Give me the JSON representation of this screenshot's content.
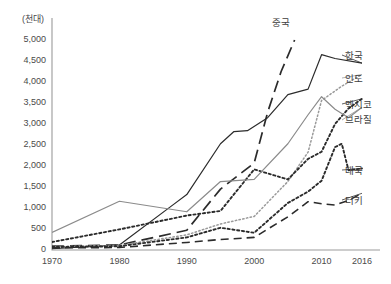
{
  "chart_data": {
    "type": "line",
    "title": "",
    "subtitle": "",
    "xlabel": "",
    "ylabel": "(천대)",
    "unit_label": "(천대)",
    "grid": false,
    "legend_position": "right-inline",
    "xlim": [
      1970,
      2016
    ],
    "ylim": [
      0,
      5000
    ],
    "ytick_labels": [
      "5,000",
      "4,500",
      "4,000",
      "3,500",
      "3,000",
      "2,500",
      "2,000",
      "1,500",
      "1,000",
      "500",
      "0"
    ],
    "ytick_values": [
      5000,
      4500,
      4000,
      3500,
      3000,
      2500,
      2000,
      1500,
      1000,
      500,
      0
    ],
    "xtick_labels": [
      "1970",
      "1980",
      "1990",
      "2000",
      "2010",
      "2016"
    ],
    "xtick_values": [
      1970,
      1980,
      1990,
      2000,
      2010,
      2016
    ],
    "series": [
      {
        "name": "중국",
        "label": "중국",
        "style": "long-dash",
        "color": "#2b2b2b",
        "x": [
          1970,
          1980,
          1990,
          1995,
          2000,
          2002,
          2004,
          2006
        ],
        "values": [
          90,
          120,
          470,
          1450,
          2070,
          3280,
          4250,
          5000
        ]
      },
      {
        "name": "한국",
        "label": "한국",
        "style": "solid",
        "color": "#2b2b2b",
        "x": [
          1970,
          1980,
          1988,
          1990,
          1995,
          1997,
          1999,
          2002,
          2005,
          2008,
          2010,
          2012,
          2016
        ],
        "values": [
          30,
          120,
          1080,
          1320,
          2530,
          2820,
          2840,
          3150,
          3700,
          3830,
          4650,
          4560,
          4450
        ]
      },
      {
        "name": "인도",
        "label": "인도",
        "style": "fine-dotted",
        "color": "#9a9a9a",
        "x": [
          1970,
          1980,
          1990,
          1995,
          2000,
          2005,
          2008,
          2010,
          2013,
          2016
        ],
        "values": [
          80,
          110,
          360,
          620,
          800,
          1630,
          2330,
          3560,
          3900,
          4180
        ]
      },
      {
        "name": "멕시코",
        "label": "멕시코",
        "style": "dotted",
        "color": "#2b2b2b",
        "x": [
          1970,
          1980,
          1990,
          1995,
          2000,
          2005,
          2008,
          2010,
          2012,
          2014,
          2016
        ],
        "values": [
          190,
          490,
          820,
          930,
          1920,
          1680,
          2170,
          2340,
          3000,
          3370,
          3600
        ]
      },
      {
        "name": "브라질",
        "label": "브라질",
        "style": "solid",
        "color": "#8b8b8b",
        "x": [
          1970,
          1980,
          1990,
          1995,
          2000,
          2005,
          2008,
          2010,
          2012,
          2014,
          2016
        ],
        "values": [
          420,
          1160,
          910,
          1630,
          1680,
          2530,
          3220,
          3650,
          3350,
          3150,
          3400
        ]
      },
      {
        "name": "태국",
        "label": "태국",
        "style": "dotted",
        "color": "#2b2b2b",
        "x": [
          1970,
          1980,
          1990,
          1995,
          2000,
          2005,
          2008,
          2010,
          2012,
          2013,
          2014,
          2016
        ],
        "values": [
          70,
          90,
          300,
          530,
          410,
          1120,
          1390,
          1650,
          2450,
          2530,
          1900,
          1940
        ]
      },
      {
        "name": "터키",
        "label": "터키",
        "style": "dash",
        "color": "#2b2b2b",
        "x": [
          1970,
          1980,
          1990,
          1995,
          2000,
          2005,
          2008,
          2010,
          2012,
          2014,
          2016
        ],
        "values": [
          50,
          60,
          180,
          250,
          300,
          790,
          1150,
          1100,
          1070,
          1180,
          1350
        ]
      }
    ]
  },
  "series_labels": [
    {
      "text": "중국",
      "x": 272,
      "y": 22
    },
    {
      "text": "한국",
      "x": 345,
      "y": 55
    },
    {
      "text": "인도",
      "x": 345,
      "y": 78
    },
    {
      "text": "멕시코",
      "x": 345,
      "y": 104
    },
    {
      "text": "브라질",
      "x": 345,
      "y": 119
    },
    {
      "text": "태국",
      "x": 345,
      "y": 170
    },
    {
      "text": "터키",
      "x": 345,
      "y": 200
    }
  ]
}
